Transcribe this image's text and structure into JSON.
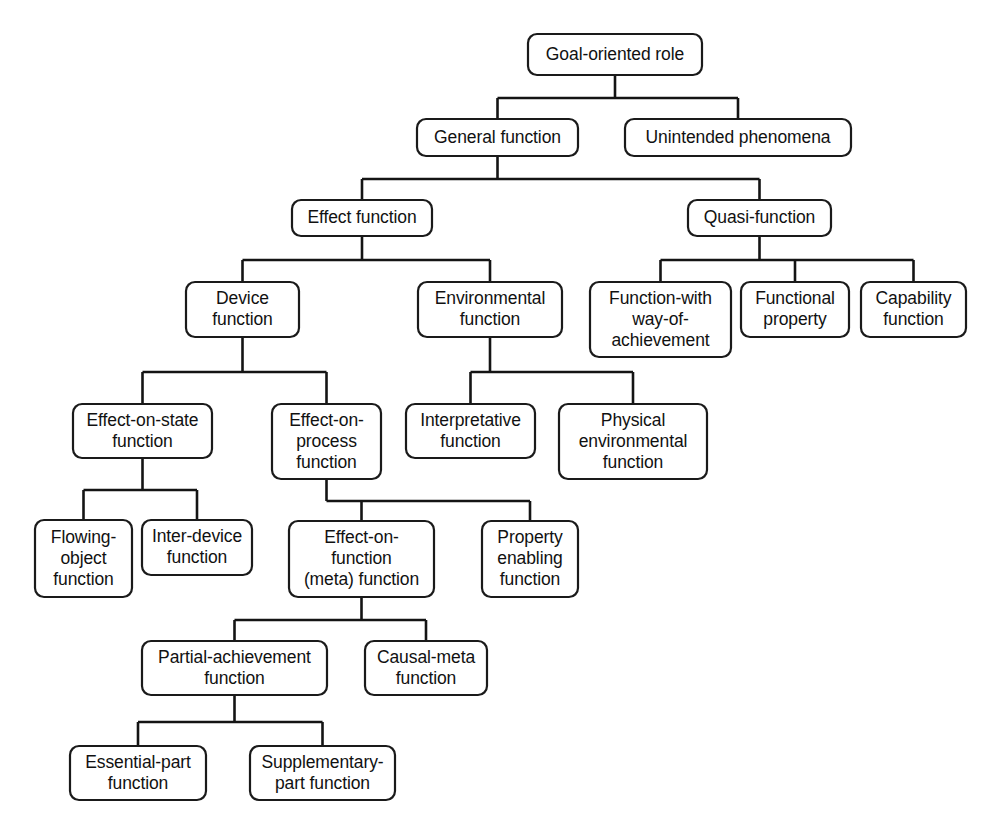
{
  "diagram": {
    "type": "tree",
    "orientation": "top-down",
    "style": {
      "box_fill": "#ffffff",
      "box_stroke": "#1a1a1a",
      "edge_color": "#141414",
      "text_color": "#111111",
      "background": "#ffffff",
      "corner_radius": 9
    },
    "nodes": [
      {
        "id": "goal-oriented-role",
        "label": "Goal-oriented role",
        "lines": [
          "Goal-oriented role"
        ],
        "x": 528,
        "y": 34,
        "w": 174,
        "h": 41,
        "level": 0
      },
      {
        "id": "general-function",
        "label": "General function",
        "lines": [
          "General function"
        ],
        "x": 417,
        "y": 119,
        "w": 161,
        "h": 37,
        "level": 1
      },
      {
        "id": "unintended-phenomena",
        "label": "Unintended phenomena",
        "lines": [
          "Unintended phenomena"
        ],
        "x": 625,
        "y": 119,
        "w": 226,
        "h": 37,
        "level": 1
      },
      {
        "id": "effect-function",
        "label": "Effect function",
        "lines": [
          "Effect function"
        ],
        "x": 292,
        "y": 200,
        "w": 140,
        "h": 36,
        "level": 2
      },
      {
        "id": "quasi-function",
        "label": "Quasi-function",
        "lines": [
          "Quasi-function"
        ],
        "x": 688,
        "y": 200,
        "w": 143,
        "h": 36,
        "level": 2
      },
      {
        "id": "device-function",
        "label": "Device function",
        "lines": [
          "Device",
          "function"
        ],
        "x": 186,
        "y": 282,
        "w": 113,
        "h": 55,
        "level": 3
      },
      {
        "id": "environmental-function",
        "label": "Environmental function",
        "lines": [
          "Environmental",
          "function"
        ],
        "x": 418,
        "y": 282,
        "w": 144,
        "h": 55,
        "level": 3
      },
      {
        "id": "function-with-way-of-achievement",
        "label": "Function-with way-of-achievement",
        "lines": [
          "Function-with",
          "way-of-",
          "achievement"
        ],
        "x": 590,
        "y": 282,
        "w": 141,
        "h": 75,
        "level": 3
      },
      {
        "id": "functional-property",
        "label": "Functional property",
        "lines": [
          "Functional",
          "property"
        ],
        "x": 741,
        "y": 282,
        "w": 108,
        "h": 55,
        "level": 3
      },
      {
        "id": "capability-function",
        "label": "Capability function",
        "lines": [
          "Capability",
          "function"
        ],
        "x": 861,
        "y": 282,
        "w": 105,
        "h": 55,
        "level": 3
      },
      {
        "id": "effect-on-state-function",
        "label": "Effect-on-state function",
        "lines": [
          "Effect-on-state",
          "function"
        ],
        "x": 73,
        "y": 404,
        "w": 139,
        "h": 54,
        "level": 4
      },
      {
        "id": "effect-on-process-function",
        "label": "Effect-on-process function",
        "lines": [
          "Effect-on-",
          "process",
          "function"
        ],
        "x": 272,
        "y": 404,
        "w": 109,
        "h": 75,
        "level": 4
      },
      {
        "id": "interpretative-function",
        "label": "Interpretative function",
        "lines": [
          "Interpretative",
          "function"
        ],
        "x": 406,
        "y": 404,
        "w": 129,
        "h": 54,
        "level": 4
      },
      {
        "id": "physical-environmental-function",
        "label": "Physical environmental function",
        "lines": [
          "Physical",
          "environmental",
          "function"
        ],
        "x": 559,
        "y": 404,
        "w": 148,
        "h": 75,
        "level": 4
      },
      {
        "id": "flowing-object-function",
        "label": "Flowing-object function",
        "lines": [
          "Flowing-",
          "object",
          "function"
        ],
        "x": 35,
        "y": 520,
        "w": 97,
        "h": 77,
        "level": 5
      },
      {
        "id": "inter-device-function",
        "label": "Inter-device function",
        "lines": [
          "Inter-device",
          "function"
        ],
        "x": 142,
        "y": 520,
        "w": 110,
        "h": 55,
        "level": 5
      },
      {
        "id": "effect-on-function-meta-function",
        "label": "Effect-on-function (meta) function",
        "lines": [
          "Effect-on-",
          "function",
          "(meta) function"
        ],
        "x": 289,
        "y": 521,
        "w": 145,
        "h": 76,
        "level": 5
      },
      {
        "id": "property-enabling-function",
        "label": "Property enabling function",
        "lines": [
          "Property",
          "enabling",
          "function"
        ],
        "x": 482,
        "y": 521,
        "w": 96,
        "h": 76,
        "level": 5
      },
      {
        "id": "partial-achievement-function",
        "label": "Partial-achievement function",
        "lines": [
          "Partial-achievement",
          "function"
        ],
        "x": 142,
        "y": 641,
        "w": 185,
        "h": 54,
        "level": 6
      },
      {
        "id": "causal-meta-function",
        "label": "Causal-meta function",
        "lines": [
          "Causal-meta",
          "function"
        ],
        "x": 365,
        "y": 641,
        "w": 122,
        "h": 54,
        "level": 6
      },
      {
        "id": "essential-part-function",
        "label": "Essential-part function",
        "lines": [
          "Essential-part",
          "function"
        ],
        "x": 70,
        "y": 746,
        "w": 136,
        "h": 54,
        "level": 7
      },
      {
        "id": "supplementary-part-function",
        "label": "Supplementary-part function",
        "lines": [
          "Supplementary-",
          "part function"
        ],
        "x": 250,
        "y": 746,
        "w": 145,
        "h": 54,
        "level": 7
      }
    ],
    "edges": [
      {
        "id": "e-root-general",
        "parent": "goal-oriented-role",
        "child": "general-function"
      },
      {
        "id": "e-root-unintended",
        "parent": "goal-oriented-role",
        "child": "unintended-phenomena"
      },
      {
        "id": "e-general-effect",
        "parent": "general-function",
        "child": "effect-function"
      },
      {
        "id": "e-general-quasi",
        "parent": "general-function",
        "child": "quasi-function"
      },
      {
        "id": "e-effect-device",
        "parent": "effect-function",
        "child": "device-function"
      },
      {
        "id": "e-effect-environmental",
        "parent": "effect-function",
        "child": "environmental-function"
      },
      {
        "id": "e-quasi-fwwoa",
        "parent": "quasi-function",
        "child": "function-with-way-of-achievement"
      },
      {
        "id": "e-quasi-functional-property",
        "parent": "quasi-function",
        "child": "functional-property"
      },
      {
        "id": "e-quasi-capability",
        "parent": "quasi-function",
        "child": "capability-function"
      },
      {
        "id": "e-device-state",
        "parent": "device-function",
        "child": "effect-on-state-function"
      },
      {
        "id": "e-device-process",
        "parent": "device-function",
        "child": "effect-on-process-function"
      },
      {
        "id": "e-env-interpretative",
        "parent": "environmental-function",
        "child": "interpretative-function"
      },
      {
        "id": "e-env-physical",
        "parent": "environmental-function",
        "child": "physical-environmental-function"
      },
      {
        "id": "e-state-flowing",
        "parent": "effect-on-state-function",
        "child": "flowing-object-function"
      },
      {
        "id": "e-state-interdevice",
        "parent": "effect-on-state-function",
        "child": "inter-device-function"
      },
      {
        "id": "e-process-meta",
        "parent": "effect-on-process-function",
        "child": "effect-on-function-meta-function"
      },
      {
        "id": "e-process-property",
        "parent": "effect-on-process-function",
        "child": "property-enabling-function"
      },
      {
        "id": "e-meta-partial",
        "parent": "effect-on-function-meta-function",
        "child": "partial-achievement-function"
      },
      {
        "id": "e-meta-causal",
        "parent": "effect-on-function-meta-function",
        "child": "causal-meta-function"
      },
      {
        "id": "e-partial-essential",
        "parent": "partial-achievement-function",
        "child": "essential-part-function"
      },
      {
        "id": "e-partial-supplementary",
        "parent": "partial-achievement-function",
        "child": "supplementary-part-function"
      }
    ]
  }
}
